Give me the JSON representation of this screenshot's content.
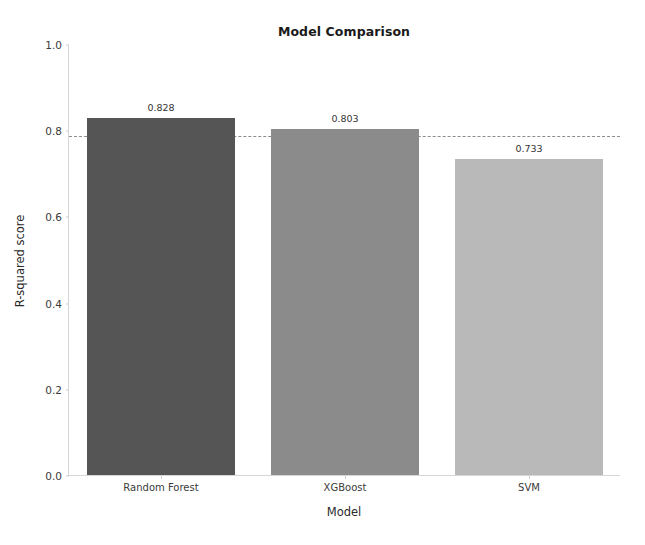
{
  "chart_data": {
    "type": "bar",
    "title": "Model Comparison",
    "xlabel": "Model",
    "ylabel": "R-squared score",
    "categories": [
      "Random Forest",
      "XGBoost",
      "SVM"
    ],
    "values": [
      0.828,
      0.803,
      0.733
    ],
    "value_labels": [
      "0.828",
      "0.803",
      "0.733"
    ],
    "bar_colors": [
      "#555555",
      "#8b8b8b",
      "#b9b9b9"
    ],
    "ylim": [
      0.0,
      1.0
    ],
    "yticks": [
      0.0,
      0.2,
      0.4,
      0.6,
      0.8,
      1.0
    ],
    "ytick_labels": [
      "0.0",
      "0.2",
      "0.4",
      "0.6",
      "0.8",
      "1.0"
    ],
    "grid": false,
    "legend": null,
    "annotations": [
      {
        "name": "threshold-line",
        "type": "hline",
        "value": 0.788,
        "style": "dashed",
        "color": "#7a7a7a"
      }
    ]
  }
}
